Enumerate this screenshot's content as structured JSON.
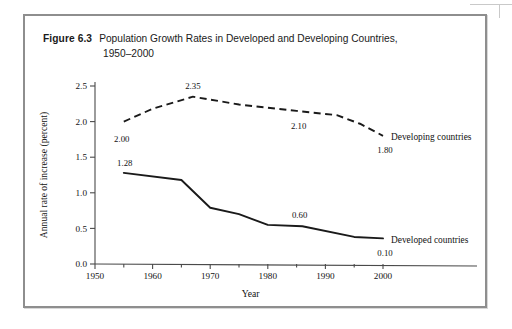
{
  "figure": {
    "number": "Figure 6.3",
    "caption_line1": "Population Growth Rates in Developed and Developing Countries,",
    "caption_line2": "1950–2000"
  },
  "chart_data": {
    "type": "line",
    "title": "Population Growth Rates in Developed and Developing Countries, 1950–2000",
    "xlabel": "Year",
    "ylabel": "Annual rate of increase (percent)",
    "xlim": [
      1950,
      2003
    ],
    "ylim": [
      0.0,
      2.5
    ],
    "grid": false,
    "legend_position": "inline-right",
    "x_ticks": [
      1950,
      1960,
      1970,
      1980,
      1990,
      2000
    ],
    "x_tick_labels": [
      "1950",
      "1960",
      "1970",
      "1980",
      "1990",
      "2000"
    ],
    "x_minor_ticks": [
      1955,
      1965,
      1975,
      1985,
      1995
    ],
    "y_ticks": [
      0.0,
      0.5,
      1.0,
      1.5,
      2.0,
      2.5
    ],
    "y_tick_labels": [
      "0.0",
      "0.5",
      "1.0",
      "1.5",
      "2.0",
      "2.5"
    ],
    "series": [
      {
        "name": "Developing countries",
        "style": "dashed",
        "x": [
          1955,
          1960,
          1967,
          1975,
          1985,
          1992,
          1996,
          2000
        ],
        "values": [
          2.0,
          2.18,
          2.35,
          2.24,
          2.15,
          2.09,
          1.97,
          1.8
        ],
        "labels": [
          {
            "text": "2.00",
            "x": 1955,
            "y": 2.0
          },
          {
            "text": "2.35",
            "x": 1967,
            "y": 2.35
          },
          {
            "text": "2.10",
            "x": 1985,
            "y": 2.15
          },
          {
            "text": "1.80",
            "x": 2000,
            "y": 1.8
          }
        ]
      },
      {
        "name": "Developed countries",
        "style": "solid",
        "x": [
          1955,
          1965,
          1970,
          1975,
          1980,
          1986,
          1995,
          2000
        ],
        "values": [
          1.28,
          1.18,
          0.79,
          0.7,
          0.55,
          0.53,
          0.38,
          0.36
        ],
        "labels": [
          {
            "text": "1.28",
            "x": 1955,
            "y": 1.28
          },
          {
            "text": "0.60",
            "x": 1985,
            "y": 0.55
          },
          {
            "text": "0.10",
            "x": 2000,
            "y": 0.36
          }
        ]
      }
    ],
    "series_end_labels": [
      {
        "text": "Developing countries",
        "series": "Developing countries"
      },
      {
        "text": "Developed countries",
        "series": "Developed countries"
      }
    ]
  },
  "colors": {
    "line": "#1a1a1a",
    "axis": "#4a4a4a",
    "frame": "#8e8e8e",
    "background": "#ffffff"
  }
}
